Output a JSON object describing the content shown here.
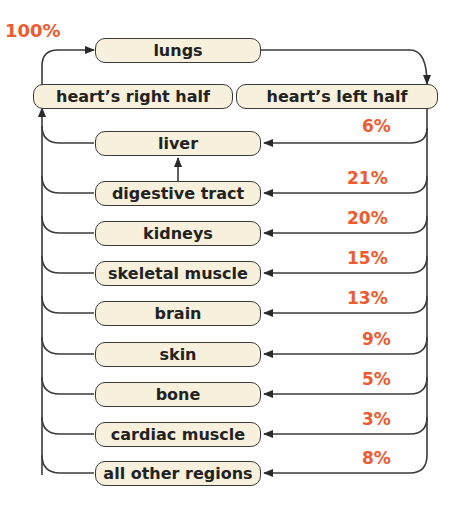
{
  "diagram": {
    "total_label": "100%",
    "top": {
      "lungs": "lungs",
      "heart_right": "heart’s right half",
      "heart_left": "heart’s left half"
    },
    "organs": [
      {
        "name": "liver",
        "percent": "6%"
      },
      {
        "name": "digestive tract",
        "percent": "21%"
      },
      {
        "name": "kidneys",
        "percent": "20%"
      },
      {
        "name": "skeletal muscle",
        "percent": "15%"
      },
      {
        "name": "brain",
        "percent": "13%"
      },
      {
        "name": "skin",
        "percent": "9%"
      },
      {
        "name": "bone",
        "percent": "5%"
      },
      {
        "name": "cardiac muscle",
        "percent": "3%"
      },
      {
        "name": "all other regions",
        "percent": "8%"
      }
    ],
    "colors": {
      "box_fill": "#f6f0dc",
      "percent": "#ef5a2e",
      "line": "#3a3a3a"
    }
  }
}
